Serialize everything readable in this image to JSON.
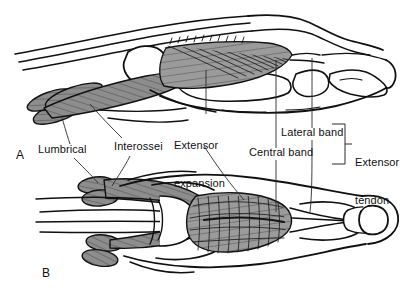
{
  "figure": {
    "background_color": "#ffffff",
    "ink_color": "#101010",
    "muscle_fill_color": "#8f8f8f",
    "expansion_fill_color": "#9a9a9a",
    "width": 409,
    "height": 290
  },
  "panels": [
    {
      "id": "A",
      "label": "A",
      "view": "lateral",
      "x": 16,
      "y": 150
    },
    {
      "id": "B",
      "label": "B",
      "view": "dorsal",
      "x": 42,
      "y": 268
    }
  ],
  "labels": [
    {
      "name": "lumbrical",
      "text": "Lumbrical",
      "x": 38,
      "y": 149,
      "lines": [
        "Lumbrical"
      ]
    },
    {
      "name": "interossei",
      "text": "Interossei",
      "x": 114,
      "y": 146,
      "lines": [
        "Interossei"
      ]
    },
    {
      "name": "extensor-expansion",
      "text": "Extensor expansion",
      "x": 174,
      "y": 120,
      "lines": [
        "Extensor",
        "expansion"
      ]
    },
    {
      "name": "central-band",
      "text": "Central band",
      "x": 250,
      "y": 152,
      "lines": [
        "Central band"
      ]
    },
    {
      "name": "lateral-band",
      "text": "Lateral band",
      "x": 282,
      "y": 132,
      "lines": [
        "Lateral band"
      ]
    },
    {
      "name": "extensor-tendon",
      "text": "Extensor tendon",
      "x": 355,
      "y": 135,
      "lines": [
        "Extensor",
        "tendon"
      ]
    }
  ],
  "bracket": {
    "name": "extensor-tendon-bracket",
    "groups": [
      "Lateral band",
      "Central band"
    ],
    "label": "Extensor tendon"
  }
}
